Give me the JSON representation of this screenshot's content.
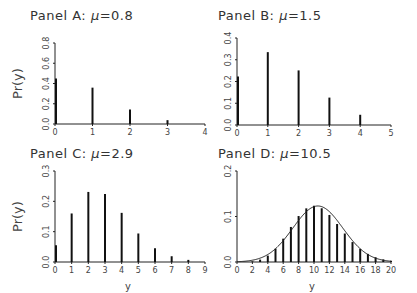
{
  "chart_data": [
    {
      "type": "bar",
      "title": "Panel A: μ=0.8",
      "title_prefix": "Panel A: ",
      "title_mu": "0.8",
      "xlabel": "",
      "ylabel": "Pr(y)",
      "x": [
        0,
        1,
        2,
        3
      ],
      "values": [
        0.449,
        0.359,
        0.144,
        0.038
      ],
      "xlim": [
        0,
        4
      ],
      "ylim": [
        0,
        0.8
      ],
      "xticks": [
        0,
        1,
        2,
        3,
        4
      ],
      "yticks": [
        "0.0",
        "0.2",
        "0.4",
        "0.6",
        "0.8"
      ],
      "yticks_num": [
        0,
        0.2,
        0.4,
        0.6,
        0.8
      ],
      "grid": false
    },
    {
      "type": "bar",
      "title": "Panel B: μ=1.5",
      "title_prefix": "Panel B: ",
      "title_mu": "1.5",
      "xlabel": "",
      "ylabel": "",
      "x": [
        0,
        1,
        2,
        3,
        4
      ],
      "values": [
        0.223,
        0.335,
        0.251,
        0.126,
        0.047
      ],
      "xlim": [
        0,
        5
      ],
      "ylim": [
        0,
        0.4
      ],
      "xticks": [
        0,
        1,
        2,
        3,
        4,
        5
      ],
      "yticks": [
        "0.0",
        "0.1",
        "0.2",
        "0.3",
        "0.4"
      ],
      "yticks_num": [
        0,
        0.1,
        0.2,
        0.3,
        0.4
      ],
      "grid": false
    },
    {
      "type": "bar",
      "title": "Panel C: μ=2.9",
      "title_prefix": "Panel C: ",
      "title_mu": "2.9",
      "xlabel": "y",
      "ylabel": "Pr(y)",
      "x": [
        0,
        1,
        2,
        3,
        4,
        5,
        6,
        7,
        8
      ],
      "values": [
        0.055,
        0.16,
        0.231,
        0.224,
        0.162,
        0.094,
        0.045,
        0.019,
        0.007
      ],
      "xlim": [
        0,
        9
      ],
      "ylim": [
        0,
        0.3
      ],
      "xticks": [
        0,
        1,
        2,
        3,
        4,
        5,
        6,
        7,
        8,
        9
      ],
      "yticks": [
        "0.0",
        "0.1",
        "0.2",
        "0.3"
      ],
      "yticks_num": [
        0,
        0.1,
        0.2,
        0.3
      ],
      "grid": false
    },
    {
      "type": "bar",
      "title": "Panel D: μ=10.5",
      "title_prefix": "Panel D: ",
      "title_mu": "10.5",
      "xlabel": "y",
      "ylabel": "",
      "x": [
        0,
        1,
        2,
        3,
        4,
        5,
        6,
        7,
        8,
        9,
        10,
        11,
        12,
        13,
        14,
        15,
        16,
        17,
        18,
        19,
        20
      ],
      "values": [
        3e-05,
        0.0003,
        0.0015,
        0.0053,
        0.014,
        0.0293,
        0.0513,
        0.077,
        0.101,
        0.1179,
        0.1238,
        0.1181,
        0.1034,
        0.0835,
        0.0626,
        0.0438,
        0.0288,
        0.0178,
        0.0104,
        0.0057,
        0.003
      ],
      "overlay": "normal density curve (mean 10.5, sd 3.24)",
      "xlim": [
        0,
        20
      ],
      "ylim": [
        0,
        0.2
      ],
      "xticks": [
        0,
        2,
        4,
        6,
        8,
        10,
        12,
        14,
        16,
        18,
        20
      ],
      "yticks": [
        "0.0",
        "0.1",
        "0.2"
      ],
      "yticks_num": [
        0,
        0.1,
        0.2
      ],
      "grid": false
    }
  ],
  "layout": [
    {
      "ox": 55,
      "oy": 124,
      "w": 150,
      "h": 81,
      "tx": 30,
      "ty": 20
    },
    {
      "ox": 237,
      "oy": 125,
      "w": 154,
      "h": 87,
      "tx": 218,
      "ty": 20
    },
    {
      "ox": 55,
      "oy": 262,
      "w": 150,
      "h": 91,
      "tx": 30,
      "ty": 158
    },
    {
      "ox": 237,
      "oy": 262,
      "w": 154,
      "h": 91,
      "tx": 218,
      "ty": 158
    }
  ]
}
